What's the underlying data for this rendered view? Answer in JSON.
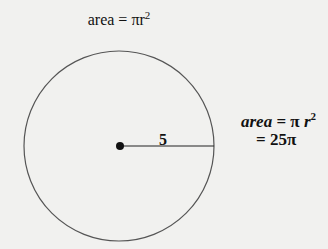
{
  "diagram": {
    "title_formula": {
      "prefix": "area = πr",
      "exponent": "2"
    },
    "radius_label": "5",
    "result_formula": {
      "line1_var": "area",
      "line1_eq": " = π ",
      "line1_r": "r",
      "line1_exp": "2",
      "line2": "= 25π"
    },
    "circle": {
      "center": [
        119,
        146
      ],
      "radius": 95,
      "stroke": "#555555"
    }
  }
}
